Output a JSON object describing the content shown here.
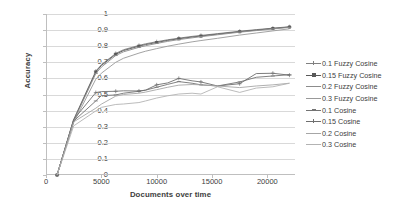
{
  "chart_data": {
    "type": "line",
    "title": "",
    "xlabel": "Documents over time",
    "ylabel": "Accuracy",
    "xlim": [
      0,
      22500
    ],
    "ylim": [
      0,
      1
    ],
    "grid": "horizontal",
    "legend_position": "right",
    "xticks": [
      "0",
      "5000",
      "10000",
      "15000",
      "20000"
    ],
    "xtick_values": [
      0,
      5000,
      10000,
      15000,
      20000
    ],
    "yticks": [
      "0",
      "0.1",
      "0.2",
      "0.3",
      "0.4",
      "0.5",
      "0.6",
      "0.7",
      "0.8",
      "0.9",
      "1"
    ],
    "ytick_values": [
      0,
      0.1,
      0.2,
      0.3,
      0.4,
      0.5,
      0.6,
      0.7,
      0.8,
      0.9,
      1
    ],
    "x": [
      1000,
      2500,
      4500,
      5000,
      6300,
      7000,
      8400,
      9000,
      10000,
      11000,
      12000,
      13200,
      14000,
      15500,
      17500,
      19000,
      20500,
      22000
    ],
    "series": [
      {
        "name": "0.1 Fuzzy Cosine",
        "marker": "cross",
        "color": "#808080",
        "values": [
          0.0,
          0.345,
          0.645,
          0.685,
          0.755,
          0.778,
          0.805,
          0.815,
          0.828,
          0.84,
          0.85,
          0.861,
          0.867,
          0.878,
          0.893,
          0.903,
          0.912,
          0.921
        ]
      },
      {
        "name": "0.15 Fuzzy Cosine",
        "marker": "square",
        "color": "#595959",
        "values": [
          0.0,
          0.34,
          0.64,
          0.68,
          0.75,
          0.773,
          0.8,
          0.81,
          0.823,
          0.836,
          0.846,
          0.857,
          0.863,
          0.875,
          0.89,
          0.9,
          0.91,
          0.919
        ]
      },
      {
        "name": "0.2  Fuzzy Cosine",
        "marker": "dash",
        "color": "#8c8c8c",
        "values": [
          0.0,
          0.335,
          0.63,
          0.67,
          0.742,
          0.765,
          0.793,
          0.803,
          0.817,
          0.83,
          0.841,
          0.852,
          0.859,
          0.871,
          0.887,
          0.897,
          0.907,
          0.917
        ]
      },
      {
        "name": "0.3  Fuzzy Cosine",
        "marker": "none",
        "color": "#999999",
        "values": [
          0.0,
          0.325,
          0.595,
          0.632,
          0.7,
          0.725,
          0.757,
          0.769,
          0.785,
          0.8,
          0.813,
          0.827,
          0.835,
          0.849,
          0.869,
          0.882,
          0.895,
          0.908
        ]
      },
      {
        "name": "0.1 Cosine",
        "marker": "dash",
        "color": "#737373",
        "values": [
          0.0,
          0.335,
          0.46,
          0.493,
          0.497,
          0.508,
          0.52,
          0.527,
          0.545,
          0.563,
          0.58,
          0.57,
          0.56,
          0.553,
          0.578,
          0.607,
          0.615,
          0.623
        ]
      },
      {
        "name": "0.15 Cosine",
        "marker": "cross",
        "color": "#6e6e6e",
        "values": [
          0.0,
          0.345,
          0.512,
          0.518,
          0.52,
          0.523,
          0.522,
          0.527,
          0.56,
          0.572,
          0.6,
          0.585,
          0.578,
          0.553,
          0.567,
          0.63,
          0.632,
          0.62
        ]
      },
      {
        "name": "0.2 Cosine",
        "marker": "none",
        "color": "#a6a6a6",
        "values": [
          0.0,
          0.33,
          0.415,
          0.44,
          0.49,
          0.5,
          0.508,
          0.515,
          0.53,
          0.545,
          0.558,
          0.562,
          0.56,
          0.553,
          0.543,
          0.553,
          0.56,
          0.57
        ]
      },
      {
        "name": "0.3 Cosine",
        "marker": "none",
        "color": "#b3b3b3",
        "values": [
          0.0,
          0.305,
          0.398,
          0.42,
          0.438,
          0.441,
          0.45,
          0.46,
          0.478,
          0.492,
          0.503,
          0.508,
          0.503,
          0.548,
          0.513,
          0.54,
          0.548,
          0.57
        ]
      }
    ]
  },
  "legend": {
    "items": [
      {
        "label": "0.1 Fuzzy Cosine"
      },
      {
        "label": "0.15 Fuzzy Cosine"
      },
      {
        "label": "0.2  Fuzzy Cosine"
      },
      {
        "label": "0.3  Fuzzy Cosine"
      },
      {
        "label": "0.1 Cosine"
      },
      {
        "label": "0.15 Cosine"
      },
      {
        "label": "0.2 Cosine"
      },
      {
        "label": "0.3 Cosine"
      }
    ]
  }
}
